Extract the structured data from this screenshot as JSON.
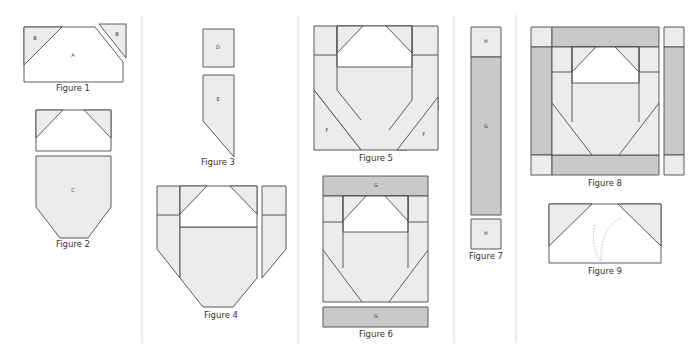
{
  "page": {
    "colors": {
      "light": "#ececec",
      "white": "#ffffff",
      "gray": "#c9c9c9",
      "stroke": "#4a4a4a",
      "divider": "#d6d6d6"
    }
  },
  "dividers": [
    {
      "x": 142,
      "y1": 15,
      "y2": 343
    },
    {
      "x": 298,
      "y1": 15,
      "y2": 343
    },
    {
      "x": 454,
      "y1": 15,
      "y2": 343
    },
    {
      "x": 516,
      "y1": 15,
      "y2": 343
    }
  ],
  "figures": [
    {
      "id": "figure-1",
      "caption": "Figure 1",
      "caption_pos": [
        73,
        91
      ],
      "pieces": [
        {
          "fill": "white",
          "points": "24,27 62,27 95,27 123,62 123,82 24,82"
        },
        {
          "fill": "light",
          "points": "24,27 62,27 24,65",
          "label": "B",
          "label_pos": [
            35,
            39
          ]
        },
        {
          "fill": "light",
          "points": "99,24 126,24 126,58",
          "label": "B",
          "label_pos": [
            117,
            35
          ]
        }
      ],
      "labels": [
        {
          "text": "A",
          "pos": [
            73,
            56
          ]
        }
      ]
    },
    {
      "id": "figure-2",
      "caption": "Figure 2",
      "caption_pos": [
        73,
        247
      ],
      "pieces": [
        {
          "fill": "white",
          "points": "36,110 111,110 111,151 36,151"
        },
        {
          "fill": "light",
          "points": "36,110 63,110 36,138"
        },
        {
          "fill": "light",
          "points": "84,110 111,110 111,138"
        },
        {
          "fill": "light",
          "points": "36,156 111,156 111,207 88,238 60,238 36,207",
          "label": "C",
          "label_pos": [
            73,
            191
          ]
        }
      ]
    },
    {
      "id": "figure-3",
      "caption": "Figure 3",
      "caption_pos": [
        218,
        165
      ],
      "pieces": [
        {
          "fill": "light",
          "points": "203,29 234,29 234,67 203,67",
          "label": "D",
          "label_pos": [
            218,
            48
          ]
        },
        {
          "fill": "light",
          "points": "203,75 234,75 234,157 203,121",
          "label": "E",
          "label_pos": [
            218,
            100
          ]
        }
      ]
    },
    {
      "id": "figure-4",
      "caption": "Figure 4",
      "caption_pos": [
        221,
        318
      ],
      "pieces": [
        {
          "fill": "light",
          "points": "157,186 180,186 180,278 157,249"
        },
        {
          "fill": "light",
          "points": "180,227 257,227 257,278 233,307 203,307 180,278"
        },
        {
          "fill": "white",
          "points": "180,186 257,186 257,227 180,227"
        },
        {
          "fill": "light",
          "points": "180,186 207,186 180,214"
        },
        {
          "fill": "light",
          "points": "230,186 257,186 257,214"
        },
        {
          "fill": "light",
          "points": "262,186 286,186 286,249 262,278"
        }
      ],
      "lines": [
        "157,215 180,215",
        "262,215 286,215"
      ]
    },
    {
      "id": "figure-5",
      "caption": "Figure 5",
      "caption_pos": [
        376,
        161
      ],
      "pieces": [
        {
          "fill": "light",
          "points": "314,26 438,26 438,110 407,150 361,150 314,90"
        },
        {
          "fill": "white",
          "points": "337,26 412,26 412,67 337,67"
        },
        {
          "fill": "light",
          "points": "337,26 363,26 337,53"
        },
        {
          "fill": "light",
          "points": "386,26 412,26 412,53"
        },
        {
          "fill": "light",
          "points": "314,90 361,150 314,150",
          "label": "F",
          "label_pos": [
            327,
            131
          ]
        },
        {
          "fill": "light",
          "points": "438,97 438,150 397,150",
          "label": "F",
          "label_pos": [
            424,
            135
          ]
        }
      ],
      "lines": [
        "337,26 337,90",
        "412,26 412,100",
        "314,55 337,55",
        "412,55 438,55",
        "337,90 361,120",
        "412,100 389,130"
      ]
    },
    {
      "id": "figure-6",
      "caption": "Figure 6",
      "caption_pos": [
        376,
        337
      ],
      "pieces": [
        {
          "fill": "gray",
          "points": "323,176 428,176 428,196 323,196",
          "label": "G",
          "label_pos": [
            376,
            186
          ]
        },
        {
          "fill": "light",
          "points": "323,196 428,196 428,302 323,302"
        },
        {
          "fill": "white",
          "points": "343,196 408,196 408,232 343,232"
        },
        {
          "fill": "light",
          "points": "343,196 366,196 343,221"
        },
        {
          "fill": "light",
          "points": "385,196 408,196 408,221"
        },
        {
          "fill": "gray",
          "points": "323,307 428,307 428,327 323,327",
          "label": "G",
          "label_pos": [
            376,
            317
          ]
        }
      ],
      "lines": [
        "343,196 343,268",
        "408,196 408,268",
        "323,222 343,222",
        "408,222 428,222",
        "323,250 362,302",
        "428,250 389,302"
      ]
    },
    {
      "id": "figure-7",
      "caption": "Figure 7",
      "caption_pos": [
        486,
        259
      ],
      "pieces": [
        {
          "fill": "light",
          "points": "471,27 501,27 501,57 471,57",
          "label": "H",
          "label_pos": [
            486,
            42
          ]
        },
        {
          "fill": "gray",
          "points": "471,57 501,57 501,215 471,215",
          "label": "G",
          "label_pos": [
            486,
            127
          ]
        },
        {
          "fill": "light",
          "points": "471,219 501,219 501,249 471,249",
          "label": "H",
          "label_pos": [
            486,
            234
          ]
        }
      ]
    },
    {
      "id": "figure-8",
      "caption": "Figure 8",
      "caption_pos": [
        605,
        186
      ],
      "pieces": [
        {
          "fill": "light",
          "points": "531,27 552,27 552,47 531,47"
        },
        {
          "fill": "gray",
          "points": "552,27 659,27 659,47 552,47"
        },
        {
          "fill": "gray",
          "points": "531,47 552,47 552,155 531,155"
        },
        {
          "fill": "light",
          "points": "531,155 552,155 552,175 531,175"
        },
        {
          "fill": "gray",
          "points": "552,155 659,155 659,175 552,175"
        },
        {
          "fill": "light",
          "points": "552,47 659,47 659,155 552,155"
        },
        {
          "fill": "white",
          "points": "572,47 639,47 639,83 572,83"
        },
        {
          "fill": "light",
          "points": "572,47 596,47 572,72"
        },
        {
          "fill": "light",
          "points": "615,47 639,47 639,72"
        },
        {
          "fill": "light",
          "points": "664,27 684,27 684,47 664,47"
        },
        {
          "fill": "gray",
          "points": "664,47 684,47 684,155 664,155"
        },
        {
          "fill": "light",
          "points": "664,155 684,155 684,175 664,175"
        }
      ],
      "lines": [
        "572,47 572,122",
        "639,47 639,122",
        "552,72 572,72",
        "639,72 659,72",
        "552,103 592,155",
        "659,103 619,155"
      ]
    },
    {
      "id": "figure-9",
      "caption": "Figure 9",
      "caption_pos": [
        605,
        274
      ],
      "pieces": [
        {
          "fill": "white",
          "points": "549,204 661,204 661,263 549,263"
        },
        {
          "fill": "light",
          "points": "549,204 592,204 549,246"
        },
        {
          "fill": "light",
          "points": "618,204 661,204 661,246"
        }
      ],
      "dashed": [
        "M595,225 Q590,245 601,262",
        "M621,218 Q600,228 601,262"
      ]
    }
  ]
}
